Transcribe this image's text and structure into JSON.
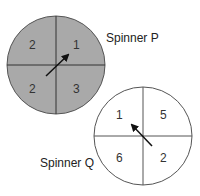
{
  "spinners": [
    {
      "label": "Spinner P",
      "fill": "#a9a9a9",
      "sections": {
        "top_left": "2",
        "top_right": "1",
        "bottom_left": "2",
        "bottom_right": "3"
      },
      "arrow_direction": "up-right"
    },
    {
      "label": "Spinner Q",
      "fill": "#ffffff",
      "sections": {
        "top_left": "1",
        "top_right": "5",
        "bottom_left": "6",
        "bottom_right": "2"
      },
      "arrow_direction": "up-left"
    }
  ]
}
